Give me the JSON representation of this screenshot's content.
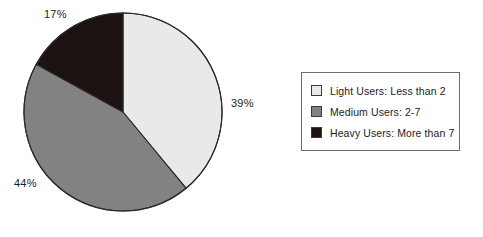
{
  "chart_data": {
    "type": "pie",
    "title": "",
    "categories": [
      "Light Users: Less than 2",
      "Medium Users: 2-7",
      "Heavy Users: More than 7"
    ],
    "values": [
      39,
      44,
      17
    ],
    "value_labels": [
      "39%",
      "44%",
      "17%"
    ],
    "units": "percent",
    "start_angle_deg": 0,
    "direction": "clockwise",
    "legend_position": "right",
    "grid": false,
    "colors": [
      "#e9e9e9",
      "#828282",
      "#1c1212"
    ],
    "slices": [
      {
        "label": "Light Users: Less than 2",
        "value": 39,
        "value_label": "39%",
        "color": "#e9e9e9"
      },
      {
        "label": "Medium Users: 2-7",
        "value": 44,
        "value_label": "44%",
        "color": "#828282"
      },
      {
        "label": "Heavy Users: More than 7",
        "value": 17,
        "value_label": "17%",
        "color": "#1c1212"
      }
    ]
  },
  "pie": {
    "label_light": "39%",
    "label_medium": "44%",
    "label_heavy": "17%"
  },
  "legend": {
    "items": [
      {
        "label": "Light Users: Less than 2",
        "color": "#e9e9e9"
      },
      {
        "label": "Medium Users: 2-7",
        "color": "#828282"
      },
      {
        "label": "Heavy Users: More than 7",
        "color": "#1c1212"
      }
    ]
  }
}
